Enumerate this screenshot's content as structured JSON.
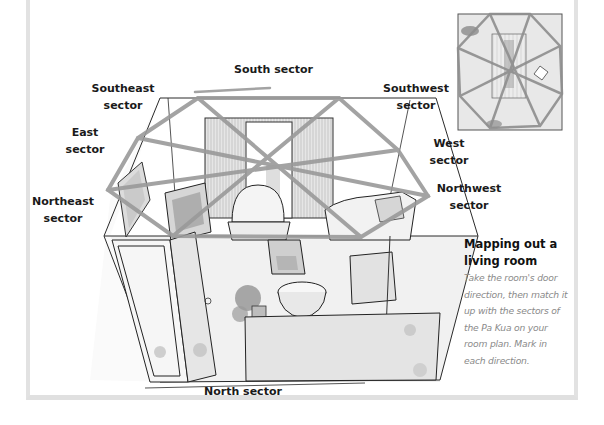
{
  "labels": {
    "south": "South sector",
    "southeast_1": "Southeast",
    "southeast_2": "sector",
    "southwest_1": "Southwest",
    "southwest_2": "sector",
    "east_1": "East",
    "east_2": "sector",
    "west_1": "West",
    "west_2": "sector",
    "northeast_1": "Northeast",
    "northeast_2": "sector",
    "northwest_1": "Northwest",
    "northwest_2": "sector",
    "north": "North sector"
  },
  "caption": {
    "title_1": "Mapping out a",
    "title_2": "living room",
    "body_lines": [
      "Take the room's door",
      "direction, then match it",
      "up with the sectors of",
      "the Pa Kua on your",
      "room plan. Mark in",
      "each direction."
    ]
  },
  "colors": {
    "frame": "#e2e2e2",
    "pa_kua_lines": "#9a9a9a",
    "sketch": "#2a2a2a",
    "caption_body": "#8a8a8a"
  },
  "illustration": {
    "main": "living-room-perspective-sketch-with-pa-kua-overlay",
    "inset": "room-floor-plan-with-pa-kua-overlay"
  }
}
